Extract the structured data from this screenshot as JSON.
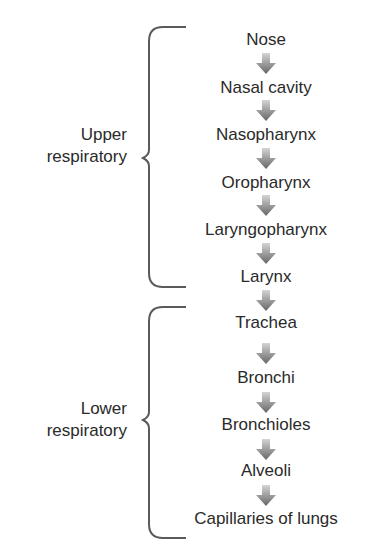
{
  "diagram": {
    "title": "",
    "groups": [
      {
        "label_line1": "Upper",
        "label_line2": "respiratory",
        "members": [
          "Nose",
          "Nasal cavity",
          "Nasopharynx",
          "Oropharynx",
          "Laryngopharynx",
          "Larynx"
        ]
      },
      {
        "label_line1": "Lower",
        "label_line2": "respiratory",
        "members": [
          "Trachea",
          "Bronchi",
          "Bronchioles",
          "Alveoli",
          "Capillaries of lungs"
        ]
      }
    ],
    "steps": [
      {
        "label": "Nose"
      },
      {
        "label": "Nasal cavity"
      },
      {
        "label": "Nasopharynx"
      },
      {
        "label": "Oropharynx"
      },
      {
        "label": "Laryngopharynx"
      },
      {
        "label": "Larynx"
      },
      {
        "label": "Trachea"
      },
      {
        "label": "Bronchi"
      },
      {
        "label": "Bronchioles"
      },
      {
        "label": "Alveoli"
      },
      {
        "label": "Capillaries of lungs"
      }
    ],
    "arrow_icon": "down-arrow-icon",
    "colors": {
      "text": "#2a2a2a",
      "arrow_top": "#d0d0d0",
      "arrow_bottom": "#6a6a6a",
      "brace": "#5a5a5a"
    }
  }
}
